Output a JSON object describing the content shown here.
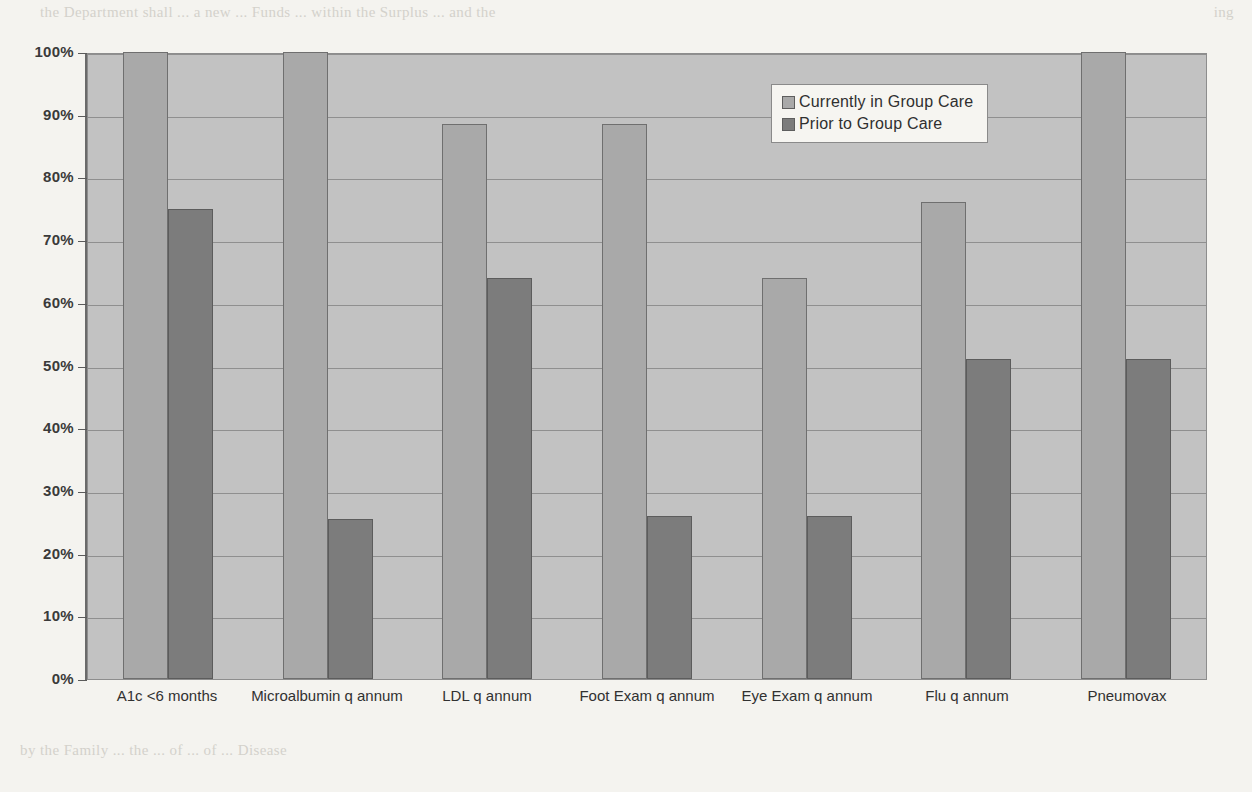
{
  "chart_data": {
    "type": "bar",
    "title": "",
    "xlabel": "",
    "ylabel": "",
    "ylim": [
      0,
      100
    ],
    "grid": true,
    "legend_position": "top-right",
    "categories": [
      "A1c <6 months",
      "Microalbumin q annum",
      "LDL q annum",
      "Foot Exam q annum",
      "Eye Exam q annum",
      "Flu q annum",
      "Pneumovax"
    ],
    "ytick_labels": [
      "100%",
      "90%",
      "80%",
      "70%",
      "60%",
      "50%",
      "40%",
      "30%",
      "20%",
      "10%",
      "0%"
    ],
    "ytick_values": [
      100,
      90,
      80,
      70,
      60,
      50,
      40,
      30,
      20,
      10,
      0
    ],
    "series": [
      {
        "name": "Currently in Group Care",
        "color": "#a9a9a9",
        "values": [
          100,
          100,
          88.5,
          88.5,
          64,
          76,
          100
        ]
      },
      {
        "name": "Prior to Group Care",
        "color": "#7c7c7c",
        "values": [
          75,
          25.5,
          64,
          26,
          26,
          51,
          51
        ]
      }
    ]
  },
  "legend": {
    "items": [
      {
        "label": "Currently in Group Care",
        "color": "#a9a9a9"
      },
      {
        "label": "Prior to Group Care",
        "color": "#7c7c7c"
      }
    ]
  },
  "background_text": {
    "top_left": "the Department shall ... a new ... Funds ... within the Surplus ... and the",
    "top_right": "ing",
    "right_lines": [
      "more",
      "ever",
      "for",
      "this",
      "exa",
      "but",
      "vate",
      "the",
      "not",
      "the",
      "any",
      "of a",
      "will"
    ],
    "left_lines": [
      "ate",
      "and",
      "on",
      "to",
      "as",
      "rk",
      "of",
      "lly",
      "to",
      "of",
      "the",
      "of"
    ],
    "bottom": "by the Family ... the ... of ... of ... Disease"
  }
}
